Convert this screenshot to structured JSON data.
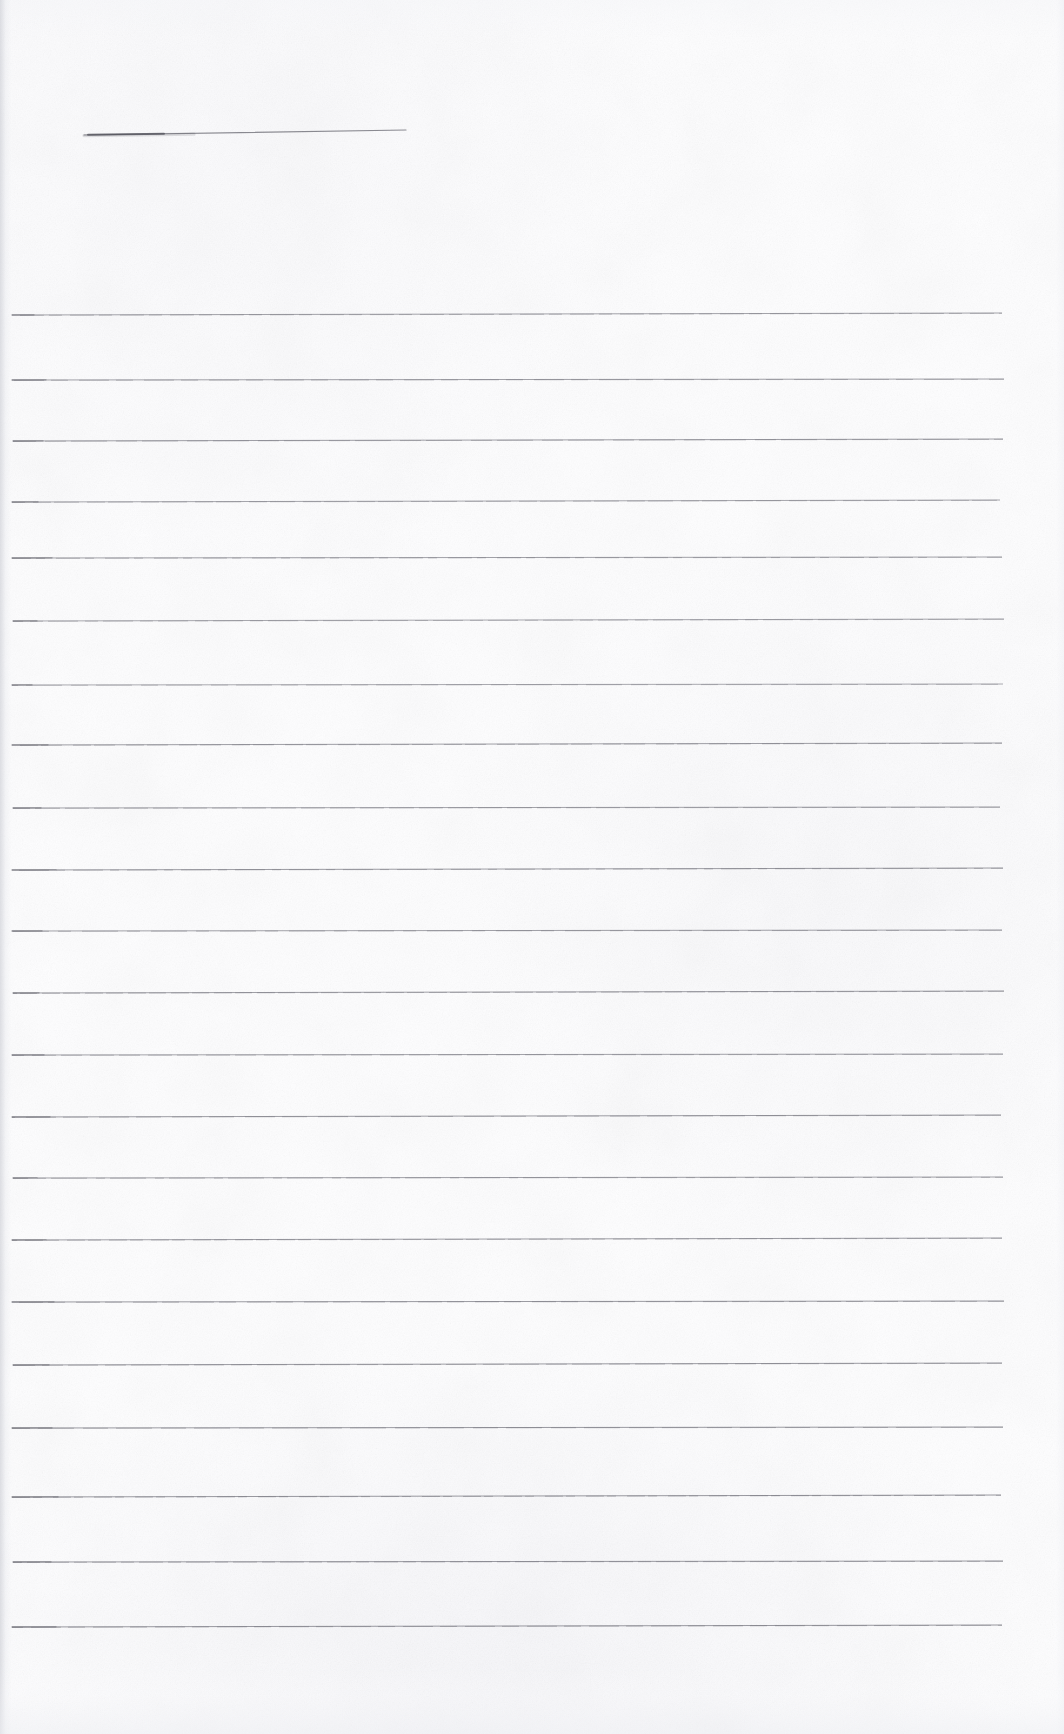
{
  "document": {
    "kind": "scanned-lined-paper",
    "title": "Blank ruled notebook page (scan)",
    "page_width": 1064,
    "page_height": 1734,
    "paper_color": "#fefeff",
    "speckle_color": "#e9eaee",
    "ink_color": "#8b8b93",
    "ink_color_dark": "#5d5d66",
    "content_text": ""
  },
  "header_rule": {
    "name": "header-underline",
    "x_start": 84,
    "x_end": 406,
    "y_start": 135,
    "y_end": 130,
    "thickness": 1.2,
    "color": "#77777f",
    "left_blot_width": 80,
    "left_blot_color": "#4f4f58"
  },
  "ruling": {
    "line_count": 22,
    "first_line_y": 315,
    "spacing": 62.5,
    "x_start": 12,
    "x_end": 1004,
    "thickness": 1.1,
    "color": "#8b8b93"
  },
  "rule_lines": [
    {
      "index": 1,
      "y": 315,
      "x_start": 12,
      "x_end": 1002,
      "slope": 2,
      "opacity": 0.78,
      "dark_head": 22
    },
    {
      "index": 2,
      "y": 380,
      "x_start": 12,
      "x_end": 1004,
      "slope": 1,
      "opacity": 0.8,
      "dark_head": 34
    },
    {
      "index": 3,
      "y": 441,
      "x_start": 13,
      "x_end": 1003,
      "slope": 2,
      "opacity": 0.82,
      "dark_head": 30
    },
    {
      "index": 4,
      "y": 502,
      "x_start": 12,
      "x_end": 1000,
      "slope": 2,
      "opacity": 0.76,
      "dark_head": 26
    },
    {
      "index": 5,
      "y": 558,
      "x_start": 12,
      "x_end": 1002,
      "slope": 1,
      "opacity": 0.8,
      "dark_head": 40
    },
    {
      "index": 6,
      "y": 621,
      "x_start": 13,
      "x_end": 1004,
      "slope": 2,
      "opacity": 0.74,
      "dark_head": 24
    },
    {
      "index": 7,
      "y": 685,
      "x_start": 12,
      "x_end": 1003,
      "slope": 1,
      "opacity": 0.72,
      "dark_head": 20
    },
    {
      "index": 8,
      "y": 745,
      "x_start": 12,
      "x_end": 1002,
      "slope": 2,
      "opacity": 0.82,
      "dark_head": 36
    },
    {
      "index": 9,
      "y": 808,
      "x_start": 13,
      "x_end": 1000,
      "slope": 1,
      "opacity": 0.78,
      "dark_head": 28
    },
    {
      "index": 10,
      "y": 870,
      "x_start": 12,
      "x_end": 1003,
      "slope": 2,
      "opacity": 0.84,
      "dark_head": 44
    },
    {
      "index": 11,
      "y": 931,
      "x_start": 12,
      "x_end": 1002,
      "slope": 1,
      "opacity": 0.8,
      "dark_head": 30
    },
    {
      "index": 12,
      "y": 993,
      "x_start": 13,
      "x_end": 1004,
      "slope": 2,
      "opacity": 0.82,
      "dark_head": 26
    },
    {
      "index": 13,
      "y": 1055,
      "x_start": 12,
      "x_end": 1003,
      "slope": 1,
      "opacity": 0.78,
      "dark_head": 32
    },
    {
      "index": 14,
      "y": 1117,
      "x_start": 12,
      "x_end": 1001,
      "slope": 2,
      "opacity": 0.84,
      "dark_head": 38
    },
    {
      "index": 15,
      "y": 1178,
      "x_start": 13,
      "x_end": 1003,
      "slope": 1,
      "opacity": 0.8,
      "dark_head": 24
    },
    {
      "index": 16,
      "y": 1240,
      "x_start": 12,
      "x_end": 1002,
      "slope": 2,
      "opacity": 0.82,
      "dark_head": 34
    },
    {
      "index": 17,
      "y": 1302,
      "x_start": 12,
      "x_end": 1004,
      "slope": 1,
      "opacity": 0.86,
      "dark_head": 42
    },
    {
      "index": 18,
      "y": 1365,
      "x_start": 13,
      "x_end": 1002,
      "slope": 2,
      "opacity": 0.84,
      "dark_head": 36
    },
    {
      "index": 19,
      "y": 1428,
      "x_start": 12,
      "x_end": 1003,
      "slope": 1,
      "opacity": 0.86,
      "dark_head": 40
    },
    {
      "index": 20,
      "y": 1497,
      "x_start": 12,
      "x_end": 1001,
      "slope": 2,
      "opacity": 0.88,
      "dark_head": 46
    },
    {
      "index": 21,
      "y": 1562,
      "x_start": 13,
      "x_end": 1003,
      "slope": 1,
      "opacity": 0.86,
      "dark_head": 38
    },
    {
      "index": 22,
      "y": 1627,
      "x_start": 12,
      "x_end": 1002,
      "slope": 2,
      "opacity": 0.88,
      "dark_head": 44
    }
  ]
}
